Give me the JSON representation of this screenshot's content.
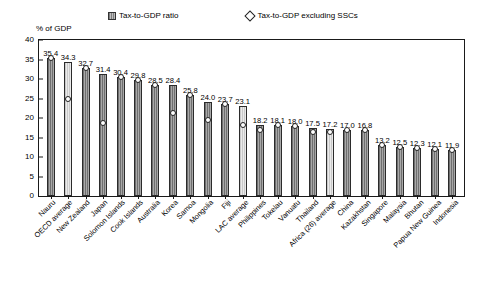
{
  "legend": {
    "series1_label": "Tax-to-GDP ratio",
    "series2_label": "Tax-to-GDP excluding SSCs",
    "swatch_icon": "hatched-square-icon",
    "marker_icon": "diamond-outline-icon"
  },
  "axis": {
    "y_title": "% of GDP",
    "y_ticks": [
      "40",
      "35",
      "30",
      "25",
      "20",
      "15",
      "10",
      "5",
      "0"
    ]
  },
  "chart_data": {
    "type": "bar",
    "title": "",
    "xlabel": "",
    "ylabel": "% of GDP",
    "ylim": [
      0,
      40
    ],
    "ytick_step": 5,
    "grid": false,
    "legend_position": "top",
    "categories": [
      "Nauru",
      "OECD average",
      "New Zealand",
      "Japan",
      "Solomon Islands",
      "Cook Islands",
      "Australia",
      "Korea",
      "Samoa",
      "Mongolia",
      "Fiji",
      "LAC average",
      "Philippines",
      "Tokelau",
      "Vanuatu",
      "Thailand",
      "Africa (26) average",
      "China",
      "Kazakhstan",
      "Singapore",
      "Malaysia",
      "Bhutan",
      "Papua New Guinea",
      "Indonesia"
    ],
    "highlight_categories": [
      "OECD average",
      "LAC average",
      "Africa (26) average"
    ],
    "series": [
      {
        "name": "Tax-to-GDP ratio",
        "type": "bar",
        "values": [
          35.4,
          34.3,
          32.7,
          31.4,
          30.4,
          29.8,
          28.5,
          28.4,
          25.8,
          24.0,
          23.7,
          23.1,
          18.2,
          18.1,
          18.0,
          17.5,
          17.2,
          17.0,
          16.8,
          13.2,
          12.5,
          12.3,
          12.1,
          11.9
        ],
        "labels": [
          "35.4",
          "34.3",
          "32.7",
          "31.4",
          "30.4",
          "29.8",
          "28.5",
          "28.4",
          "25.8",
          "24.0",
          "23.7",
          "23.1",
          "18.2",
          "18.1",
          "18.0",
          "17.5",
          "17.2",
          "17.0",
          "16.8",
          "13.2",
          "12.5",
          "12.3",
          "12.1",
          "11.9"
        ]
      },
      {
        "name": "Tax-to-GDP excluding SSCs",
        "type": "scatter",
        "values": [
          35.4,
          24.8,
          32.7,
          18.8,
          30.4,
          29.8,
          28.5,
          21.2,
          25.8,
          19.6,
          23.7,
          18.1,
          16.8,
          18.1,
          18.0,
          16.3,
          16.4,
          17.0,
          16.8,
          13.2,
          12.5,
          12.3,
          12.1,
          11.9
        ]
      }
    ]
  }
}
